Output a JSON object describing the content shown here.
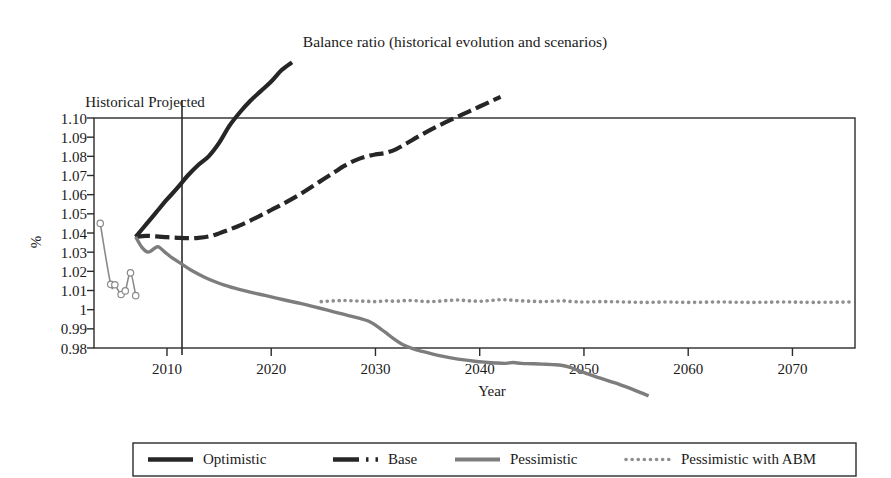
{
  "chart_data": {
    "type": "line",
    "title": "Balance ratio (historical evolution and scenarios)",
    "xlabel": "Year",
    "ylabel": "%",
    "xlim": [
      2003,
      2076
    ],
    "ylim": [
      0.98,
      1.1
    ],
    "grid": false,
    "legend_position": "bottom",
    "x_ticks": [
      "2010",
      "2020",
      "2030",
      "2040",
      "2050",
      "2060",
      "2070"
    ],
    "x_tick_values": [
      2010,
      2020,
      2030,
      2040,
      2050,
      2060,
      2070
    ],
    "y_ticks": [
      "1.10",
      "1.09",
      "1.08",
      "1.07",
      "1.06",
      "1.05",
      "1.04",
      "1.03",
      "1.02",
      "1.01",
      "1",
      "0.99",
      "0.98"
    ],
    "y_tick_values": [
      1.1,
      1.09,
      1.08,
      1.07,
      1.06,
      1.05,
      1.04,
      1.03,
      1.02,
      1.01,
      1.0,
      0.99,
      0.98
    ],
    "annotations": [
      {
        "text": "Historical",
        "x": 2005.0
      },
      {
        "text": "Projected",
        "x": 2008.2
      }
    ],
    "divider_x": 2007,
    "series": [
      {
        "name": "Historical",
        "style": "solid-thin-markers",
        "color": "#8a8a8a",
        "in_legend": false,
        "markers": true,
        "x": [
          2003.6,
          2004.6,
          2005.0,
          2005.6,
          2006.0,
          2006.5,
          2007.0
        ],
        "values": [
          1.045,
          1.0132,
          1.013,
          1.0079,
          1.0098,
          1.0192,
          1.0073
        ]
      },
      {
        "name": "Optimistic",
        "style": "solid",
        "color": "#262626",
        "width": 4.2,
        "in_legend": true,
        "x": [
          2007,
          2008,
          2009,
          2010,
          2011,
          2012,
          2013,
          2014,
          2015,
          2016,
          2017,
          2018,
          2019,
          2020,
          2021,
          2022
        ],
        "values": [
          1.038,
          1.0445,
          1.051,
          1.0575,
          1.0635,
          1.07,
          1.0755,
          1.08,
          1.087,
          1.096,
          1.103,
          1.109,
          1.114,
          1.119,
          1.125,
          1.129
        ]
      },
      {
        "name": "Base",
        "style": "dash-dot",
        "color": "#262626",
        "width": 4.2,
        "in_legend": true,
        "x": [
          2007,
          2008,
          2009,
          2010,
          2011,
          2012,
          2013,
          2014,
          2015,
          2016,
          2017,
          2018,
          2019,
          2020,
          2021,
          2022,
          2023,
          2024,
          2025,
          2026,
          2027,
          2028,
          2029,
          2030,
          2031,
          2032,
          2033,
          2034,
          2035,
          2036,
          2037,
          2038,
          2039,
          2040,
          2041,
          2042
        ],
        "values": [
          1.038,
          1.0385,
          1.0382,
          1.0378,
          1.0375,
          1.0373,
          1.0375,
          1.0382,
          1.0398,
          1.0418,
          1.044,
          1.0465,
          1.0492,
          1.052,
          1.0548,
          1.0578,
          1.061,
          1.0645,
          1.068,
          1.0715,
          1.075,
          1.0778,
          1.0798,
          1.081,
          1.0818,
          1.0838,
          1.0868,
          1.09,
          1.093,
          1.0958,
          1.0985,
          1.101,
          1.1035,
          1.106,
          1.1085,
          1.111
        ]
      },
      {
        "name": "Pessimistic",
        "style": "solid",
        "color": "#7d7d7d",
        "width": 3.4,
        "in_legend": true,
        "x": [
          2007,
          2007.6,
          2008.2,
          2008.8,
          2009.2,
          2009.8,
          2010.5,
          2011.5,
          2012.5,
          2013.5,
          2014.5,
          2015.5,
          2016.5,
          2017.5,
          2018.5,
          2019.5,
          2020.5,
          2021.5,
          2022.5,
          2023.5,
          2024.5,
          2025.5,
          2026.5,
          2027.5,
          2028.5,
          2029.5,
          2030.2,
          2031.0,
          2031.8,
          2032.6,
          2033.5,
          2034.5,
          2035.5,
          2036.5,
          2037.5,
          2038.5,
          2039.5,
          2040.5,
          2041.5,
          2042.5,
          2043.2,
          2044.0,
          2045.0,
          2046.0,
          2047.0,
          2047.8,
          2048.6,
          2049.5,
          2050.5,
          2051.5,
          2052.5,
          2053.5,
          2054.5,
          2055.5,
          2056.2
        ],
        "values": [
          1.038,
          1.0325,
          1.03,
          1.032,
          1.0328,
          1.03,
          1.027,
          1.0235,
          1.02,
          1.0172,
          1.0148,
          1.0128,
          1.0112,
          1.0098,
          1.0085,
          1.0073,
          1.006,
          1.0048,
          1.0036,
          1.0024,
          1.001,
          0.9996,
          0.9982,
          0.9968,
          0.9954,
          0.9936,
          0.9912,
          0.988,
          0.9846,
          0.9818,
          0.9798,
          0.9782,
          0.9768,
          0.9756,
          0.9746,
          0.9738,
          0.9731,
          0.9726,
          0.9722,
          0.972,
          0.9724,
          0.972,
          0.9718,
          0.9716,
          0.9713,
          0.971,
          0.97,
          0.9682,
          0.9662,
          0.9644,
          0.9626,
          0.9608,
          0.9588,
          0.9566,
          0.955
        ]
      },
      {
        "name": "Pessimistic with ABM",
        "style": "dotted",
        "color": "#8f8f8f",
        "width": 3.6,
        "in_legend": true,
        "x": [
          2024.8,
          2026,
          2027,
          2028,
          2029,
          2030,
          2031,
          2032,
          2033,
          2034,
          2035,
          2036,
          2037,
          2038,
          2039,
          2040,
          2041,
          2042,
          2043,
          2044,
          2045,
          2046,
          2047,
          2048,
          2049,
          2050,
          2052,
          2054,
          2056,
          2058,
          2060,
          2063,
          2066,
          2069,
          2072,
          2075.6
        ],
        "values": [
          1.0042,
          1.0046,
          1.0048,
          1.0046,
          1.0044,
          1.0042,
          1.0046,
          1.0044,
          1.0048,
          1.0046,
          1.0042,
          1.0044,
          1.0048,
          1.005,
          1.0046,
          1.0044,
          1.0048,
          1.0052,
          1.005,
          1.0046,
          1.0044,
          1.0042,
          1.0044,
          1.0046,
          1.0042,
          1.004,
          1.0042,
          1.004,
          1.0038,
          1.004,
          1.0038,
          1.004,
          1.0038,
          1.004,
          1.0038,
          1.004
        ]
      }
    ]
  },
  "legend": {
    "entries": [
      {
        "label": "Optimistic",
        "style": "solid",
        "color": "#262626"
      },
      {
        "label": "Base",
        "style": "dash-dot",
        "color": "#262626"
      },
      {
        "label": "Pessimistic",
        "style": "solid",
        "color": "#7d7d7d"
      },
      {
        "label": "Pessimistic with ABM",
        "style": "dotted",
        "color": "#8f8f8f"
      }
    ]
  }
}
